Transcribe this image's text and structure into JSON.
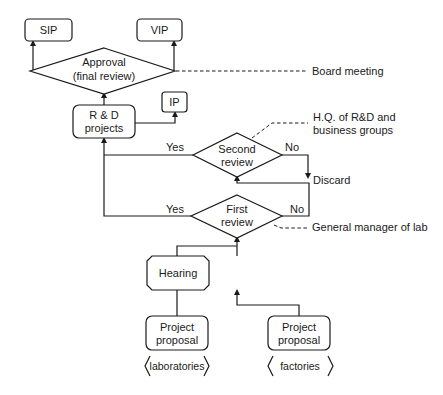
{
  "diagram": {
    "type": "flowchart",
    "nodes": {
      "sip": {
        "label": "SIP"
      },
      "vip": {
        "label": "VIP"
      },
      "approval": {
        "line1": "Approval",
        "line2": "(final review)"
      },
      "rd_projects": {
        "line1": "R & D",
        "line2": "projects"
      },
      "ip": {
        "label": "IP"
      },
      "second_review": {
        "line1": "Second",
        "line2": "review"
      },
      "first_review": {
        "line1": "First",
        "line2": "review"
      },
      "hearing": {
        "label": "Hearing"
      },
      "proposal_lab": {
        "line1": "Project",
        "line2": "proposal",
        "source": "laboratories"
      },
      "proposal_factory": {
        "line1": "Project",
        "line2": "proposal",
        "source": "factories"
      },
      "discard": {
        "label": "Discard"
      }
    },
    "edge_labels": {
      "second_yes": "Yes",
      "second_no": "No",
      "first_yes": "Yes",
      "first_no": "No"
    },
    "annotations": {
      "board_meeting": "Board meeting",
      "hq_line1": "H.Q. of R&D and",
      "hq_line2": "business groups",
      "general_manager": "General manager of lab"
    },
    "colors": {
      "stroke": "#1a1a1a",
      "background": "#ffffff"
    }
  }
}
